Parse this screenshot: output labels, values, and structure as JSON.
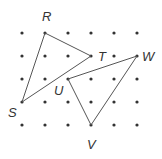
{
  "diagram": {
    "type": "dot-grid with two triangles",
    "grid": {
      "columns_x": [
        22,
        45,
        68,
        91,
        114,
        137
      ],
      "rows_y": [
        33,
        56,
        79,
        102,
        125
      ],
      "dot_color": "#333333"
    },
    "points": {
      "R": {
        "label": "R",
        "x": 45,
        "y": 33,
        "label_x": 42,
        "label_y": 21
      },
      "T": {
        "label": "T",
        "x": 91,
        "y": 56,
        "label_x": 98,
        "label_y": 61
      },
      "S": {
        "label": "S",
        "x": 22,
        "y": 102,
        "label_x": 8,
        "label_y": 117
      },
      "U": {
        "label": "U",
        "x": 68,
        "y": 79,
        "label_x": 54,
        "label_y": 95
      },
      "W": {
        "label": "W",
        "x": 137,
        "y": 56,
        "label_x": 142,
        "label_y": 61
      },
      "V": {
        "label": "V",
        "x": 91,
        "y": 125,
        "label_x": 87,
        "label_y": 149
      }
    },
    "triangles": [
      {
        "name": "RST",
        "vertices": [
          "R",
          "T",
          "S"
        ]
      },
      {
        "name": "UVW",
        "vertices": [
          "U",
          "W",
          "V"
        ]
      }
    ],
    "line_color": "#555555"
  }
}
